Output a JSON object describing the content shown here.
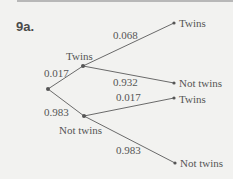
{
  "problem_label": "9a.",
  "tree": {
    "level1": [
      {
        "label": "Twins",
        "prob": "0.017"
      },
      {
        "label": "Not twins",
        "prob": "0.983"
      }
    ],
    "level2_twins": [
      {
        "label": "Twins",
        "prob": "0.068"
      },
      {
        "label": "Not twins",
        "prob": "0.932"
      }
    ],
    "level2_not_twins": [
      {
        "label": "Twins",
        "prob": "0.017"
      },
      {
        "label": "Not twins",
        "prob": "0.983"
      }
    ]
  },
  "colors": {
    "line": "#6a6a6a",
    "node": "#555555",
    "text": "#555555"
  }
}
